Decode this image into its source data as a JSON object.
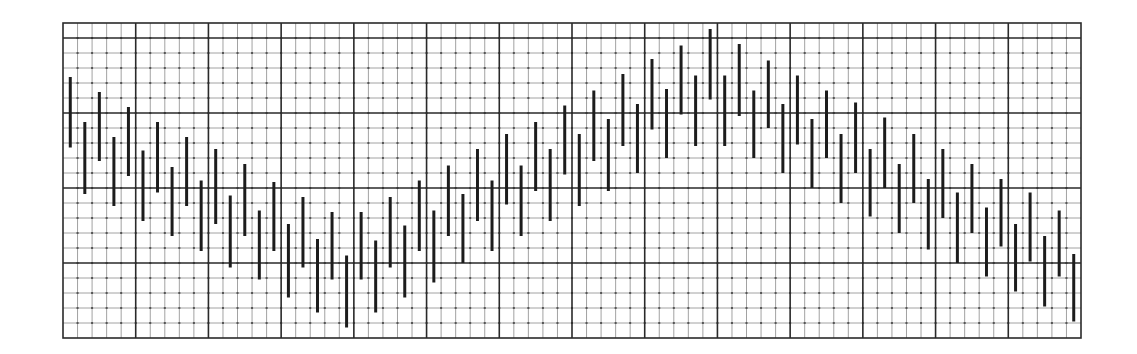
{
  "chart_data": {
    "type": "bar",
    "subtype": "high-low range bars",
    "title": "",
    "xlabel": "",
    "ylabel": "",
    "grid": true,
    "legend": null,
    "x_units": "minor grid columns (1-70)",
    "y_units": "minor grid rows from bottom",
    "xlim": [
      0,
      70
    ],
    "ylim": [
      0,
      21
    ],
    "grid_spec": {
      "minor_columns": 70,
      "major_column_every": 5,
      "minor_rows": 21,
      "major_row_positions": [
        1,
        6,
        11,
        16
      ]
    },
    "x": [
      1,
      2,
      3,
      4,
      5,
      6,
      7,
      8,
      9,
      10,
      11,
      12,
      13,
      14,
      15,
      16,
      17,
      18,
      19,
      20,
      21,
      22,
      23,
      24,
      25,
      26,
      27,
      28,
      29,
      30,
      31,
      32,
      33,
      34,
      35,
      36,
      37,
      38,
      39,
      40,
      41,
      42,
      43,
      44,
      45,
      46,
      47,
      48,
      49,
      50,
      51,
      52,
      53,
      54,
      55,
      56,
      57,
      58,
      59,
      60,
      61,
      62,
      63,
      64,
      65,
      66,
      67,
      68,
      69,
      70
    ],
    "series": [
      {
        "name": "high",
        "values": [
          17.4,
          14.4,
          16.4,
          13.4,
          15.4,
          12.5,
          14.4,
          11.4,
          13.4,
          10.5,
          12.6,
          9.5,
          11.6,
          8.5,
          10.4,
          7.6,
          9.4,
          6.6,
          8.4,
          5.5,
          8.4,
          6.5,
          9.4,
          7.5,
          10.5,
          8.5,
          11.5,
          9.6,
          12.6,
          10.5,
          13.6,
          11.5,
          14.4,
          12.6,
          15.5,
          13.6,
          16.5,
          14.6,
          17.6,
          15.6,
          18.6,
          16.6,
          19.5,
          17.5,
          20.6,
          17.5,
          19.6,
          16.5,
          18.5,
          15.6,
          17.5,
          14.6,
          16.5,
          13.6,
          15.7,
          12.6,
          14.7,
          11.6,
          13.6,
          10.6,
          12.6,
          9.7,
          11.6,
          8.7,
          10.6,
          7.6,
          9.7,
          6.8,
          8.5,
          5.6
        ]
      },
      {
        "name": "low",
        "values": [
          12.7,
          9.6,
          11.8,
          8.8,
          10.8,
          7.8,
          9.7,
          6.8,
          8.8,
          5.8,
          7.6,
          4.7,
          6.8,
          3.9,
          5.8,
          2.7,
          4.7,
          1.7,
          3.9,
          0.7,
          3.9,
          1.7,
          4.7,
          2.7,
          5.8,
          3.7,
          6.8,
          5.0,
          7.8,
          5.8,
          8.9,
          6.8,
          9.8,
          7.8,
          10.9,
          8.8,
          11.8,
          9.8,
          12.8,
          11.0,
          13.9,
          12.0,
          14.9,
          12.8,
          15.9,
          12.8,
          14.8,
          12.0,
          14.0,
          11.0,
          12.9,
          10.0,
          12.0,
          9.0,
          11.0,
          8.1,
          10.0,
          7.0,
          9.0,
          5.9,
          8.0,
          5.0,
          7.0,
          4.1,
          6.1,
          3.1,
          5.1,
          2.1,
          4.1,
          1.1
        ]
      }
    ],
    "colors": {
      "background": "#ffffff",
      "bar": "#1c1c1c",
      "minor_grid": "#8a8a8a",
      "major_grid": "#2a2a2a",
      "border": "#2a2a2a"
    }
  }
}
